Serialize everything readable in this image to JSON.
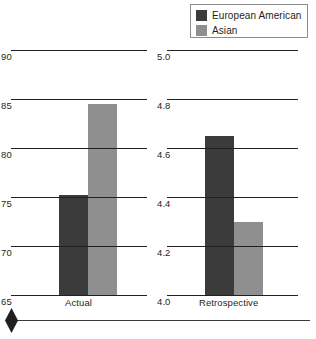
{
  "legend": {
    "items": [
      {
        "label": "European American",
        "color": "#3b3b3b",
        "icon": "legend-swatch-dark"
      },
      {
        "label": "Asian",
        "color": "#8f8f8f",
        "icon": "legend-swatch-gray"
      }
    ]
  },
  "marker": {
    "icon": "diamond-marker"
  },
  "chart_data": [
    {
      "type": "bar",
      "id": "actual",
      "title": "",
      "xlabel": "",
      "ylabel": "",
      "categories": [
        "Actual"
      ],
      "ylim": [
        65,
        90
      ],
      "yticks": [
        "65",
        "70",
        "75",
        "80",
        "85",
        "90"
      ],
      "ytick_values": [
        65,
        70,
        75,
        80,
        85,
        90
      ],
      "grid": true,
      "legend_position": "top-right",
      "series": [
        {
          "name": "European American",
          "values": [
            75.2
          ],
          "color": "#3b3b3b"
        },
        {
          "name": "Asian",
          "values": [
            84.5
          ],
          "color": "#8f8f8f"
        }
      ]
    },
    {
      "type": "bar",
      "id": "retrospective",
      "title": "",
      "xlabel": "",
      "ylabel": "",
      "categories": [
        "Retrospective"
      ],
      "ylim": [
        4.0,
        5.0
      ],
      "yticks": [
        "4.0",
        "4.2",
        "4.4",
        "4.6",
        "4.8",
        "5.0"
      ],
      "ytick_values": [
        4.0,
        4.2,
        4.4,
        4.6,
        4.8,
        5.0
      ],
      "grid": true,
      "legend_position": "top-right",
      "series": [
        {
          "name": "European American",
          "values": [
            4.65
          ],
          "color": "#3b3b3b"
        },
        {
          "name": "Asian",
          "values": [
            4.3
          ],
          "color": "#8f8f8f"
        }
      ]
    }
  ]
}
